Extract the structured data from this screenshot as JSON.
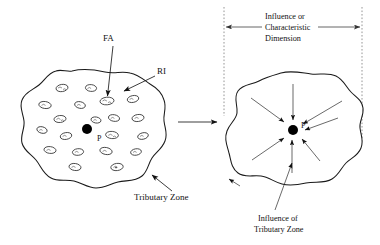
{
  "figure": {
    "labels": {
      "fa": "FA",
      "ri": "RI",
      "point_left": "P",
      "point_right": "P",
      "tributary_zone": "Tributary Zone",
      "influence_dimension_line1": "Influence or",
      "influence_dimension_line2": "Characteristic",
      "influence_dimension_line3": "Dimension",
      "influence_of_line1": "Influence of",
      "influence_of_line2": "Tributary Zone"
    },
    "colors": {
      "ink": "#1a1a1a",
      "dash": "#8a8a8a",
      "point": "#000000",
      "paper": "#ffffff"
    },
    "left_panel": {
      "name": "tributary-zone-blob",
      "point_x": 87,
      "point_y": 129,
      "aggregate_count": 20
    },
    "right_panel": {
      "name": "influence-zone-blob",
      "point_x": 293,
      "point_y": 130,
      "arrow_count": 7
    },
    "dimension": {
      "left_dash_x": 224,
      "right_dash_x": 362,
      "arrow_y": 27
    }
  }
}
